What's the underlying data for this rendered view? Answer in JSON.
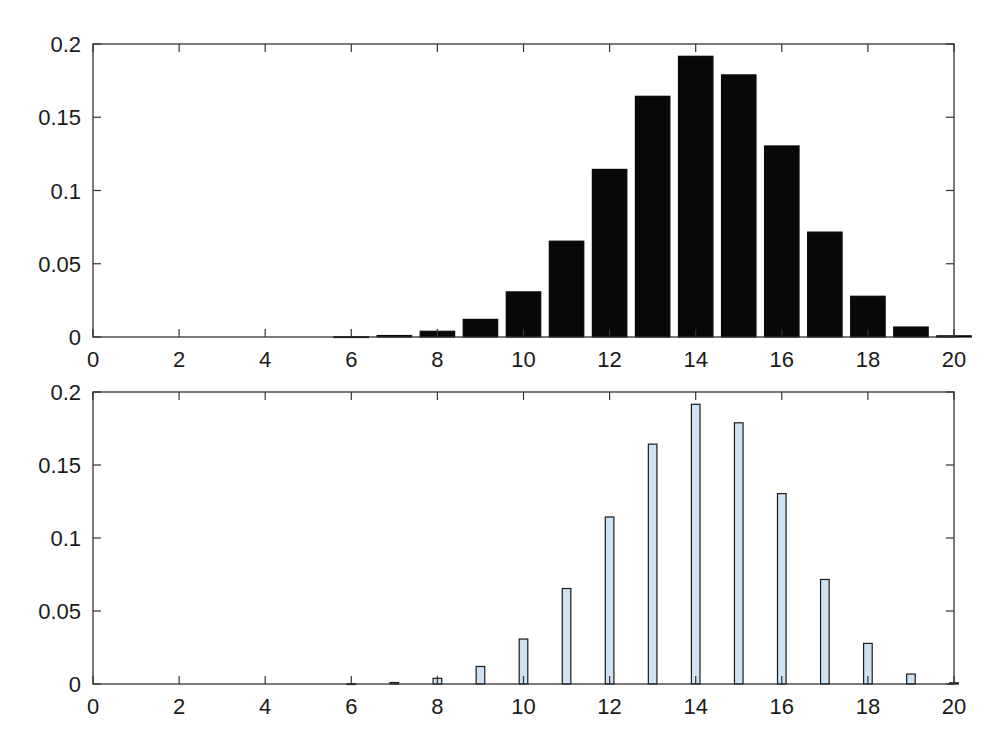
{
  "chart_data": [
    {
      "type": "bar",
      "title": "",
      "xlabel": "",
      "ylabel": "",
      "xlim": [
        0,
        20
      ],
      "ylim": [
        0,
        0.2
      ],
      "grid": false,
      "legend": null,
      "bar_style": "wide, black fill",
      "bar_color": "#0a0707",
      "xticks": [
        "0",
        "2",
        "4",
        "6",
        "8",
        "10",
        "12",
        "14",
        "16",
        "18",
        "20"
      ],
      "yticks": [
        "0",
        "0.05",
        "0.1",
        "0.15",
        "0.2"
      ],
      "x": [
        0,
        1,
        2,
        3,
        4,
        5,
        6,
        7,
        8,
        9,
        10,
        11,
        12,
        13,
        14,
        15,
        16,
        17,
        18,
        19,
        20
      ],
      "values": [
        0,
        0,
        0,
        0,
        0,
        0,
        0.0002,
        0.001,
        0.0039,
        0.012,
        0.0308,
        0.0654,
        0.1144,
        0.1643,
        0.1916,
        0.1789,
        0.1304,
        0.0716,
        0.0278,
        0.0068,
        0.0008
      ]
    },
    {
      "type": "bar",
      "title": "",
      "xlabel": "",
      "ylabel": "",
      "xlim": [
        0,
        20
      ],
      "ylim": [
        0,
        0.2
      ],
      "grid": false,
      "legend": null,
      "bar_style": "narrow, light blue fill with dark outline",
      "bar_color": "#cfe2f3",
      "xticks": [
        "0",
        "2",
        "4",
        "6",
        "8",
        "10",
        "12",
        "14",
        "16",
        "18",
        "20"
      ],
      "yticks": [
        "0",
        "0.05",
        "0.1",
        "0.15",
        "0.2"
      ],
      "x": [
        0,
        1,
        2,
        3,
        4,
        5,
        6,
        7,
        8,
        9,
        10,
        11,
        12,
        13,
        14,
        15,
        16,
        17,
        18,
        19,
        20
      ],
      "values": [
        0,
        0,
        0,
        0,
        0,
        0,
        0.0002,
        0.001,
        0.0039,
        0.012,
        0.0308,
        0.0654,
        0.1144,
        0.1643,
        0.1916,
        0.1789,
        0.1304,
        0.0716,
        0.0278,
        0.0068,
        0.0008
      ]
    }
  ],
  "layout": {
    "panels": [
      {
        "left": 93,
        "right": 954,
        "top": 44,
        "bottom": 337,
        "bar_width": 0.8,
        "fill": "#0a0707",
        "stroke": "#0a0707"
      },
      {
        "left": 93,
        "right": 954,
        "top": 392,
        "bottom": 684,
        "bar_width": 0.2,
        "fill": "#cfe2f3",
        "stroke": "#1a1a1a"
      }
    ]
  }
}
